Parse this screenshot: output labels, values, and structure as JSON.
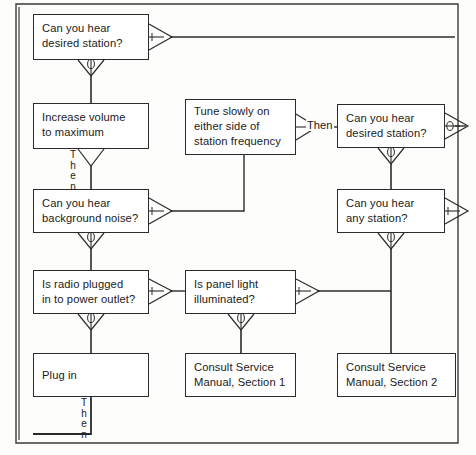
{
  "diagram": {
    "frame": {
      "color": "#2b2b2b"
    },
    "nodes": [
      {
        "id": "q-desired-station-1",
        "name": "node-can-you-hear-desired-station-1",
        "lines": [
          "Can you hear",
          "desired station?"
        ],
        "x": 33,
        "y": 14,
        "w": 116,
        "h": 46
      },
      {
        "id": "increase-volume",
        "name": "node-increase-volume-to-maximum",
        "lines": [
          "Increase volume",
          "to maximum"
        ],
        "x": 33,
        "y": 103,
        "w": 116,
        "h": 46
      },
      {
        "id": "tune-slowly",
        "name": "node-tune-slowly",
        "lines": [
          "Tune slowly on",
          "either side of",
          "station frequency"
        ],
        "x": 185,
        "y": 99,
        "w": 111,
        "h": 56
      },
      {
        "id": "q-desired-station-2",
        "name": "node-can-you-hear-desired-station-2",
        "lines": [
          "Can you hear",
          "desired station?"
        ],
        "x": 337,
        "y": 104,
        "w": 108,
        "h": 44
      },
      {
        "id": "q-background-noise",
        "name": "node-can-you-hear-background-noise",
        "lines": [
          "Can you hear",
          "background noise?"
        ],
        "x": 33,
        "y": 189,
        "w": 116,
        "h": 44
      },
      {
        "id": "q-any-station",
        "name": "node-can-you-hear-any-station",
        "lines": [
          "Can you hear",
          "any station?"
        ],
        "x": 337,
        "y": 189,
        "w": 108,
        "h": 44
      },
      {
        "id": "q-radio-plugged",
        "name": "node-is-radio-plugged-in",
        "lines": [
          "Is radio plugged",
          "in to power outlet?"
        ],
        "x": 33,
        "y": 270,
        "w": 116,
        "h": 44
      },
      {
        "id": "q-panel-light",
        "name": "node-is-panel-light-illuminated",
        "lines": [
          "Is panel light",
          "illuminated?"
        ],
        "x": 185,
        "y": 270,
        "w": 111,
        "h": 44
      },
      {
        "id": "plug-in",
        "name": "node-plug-in",
        "lines": [
          "Plug in"
        ],
        "x": 33,
        "y": 353,
        "w": 116,
        "h": 44,
        "single": true
      },
      {
        "id": "consult-1",
        "name": "node-consult-service-manual-section-1",
        "lines": [
          "Consult Service",
          "Manual, Section 1"
        ],
        "x": 185,
        "y": 353,
        "w": 111,
        "h": 44
      },
      {
        "id": "consult-2",
        "name": "node-consult-service-manual-section-2",
        "lines": [
          "Consult Service",
          "Manual, Section 2"
        ],
        "x": 337,
        "y": 353,
        "w": 119,
        "h": 44
      }
    ],
    "labels": {
      "then_vertical_1": [
        "T",
        "h",
        "e",
        "n"
      ],
      "then_vertical_2": [
        "T",
        "h",
        "e",
        "n"
      ],
      "then_horizontal": "Then",
      "yes_marker": "y",
      "no_marker": "n"
    }
  }
}
